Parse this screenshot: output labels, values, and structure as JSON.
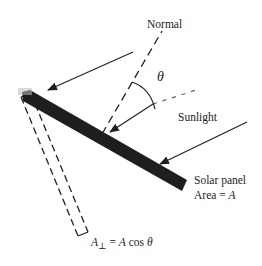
{
  "diagram": {
    "labels": {
      "normal": "Normal",
      "theta": "θ",
      "sunlight": "Sunlight",
      "panel_name": "Solar panel",
      "panel_area_prefix": "Area = ",
      "panel_area_var": "A",
      "projected_lhs_var": "A",
      "projected_lhs_sub": "⊥",
      "projected_eq": " = ",
      "projected_rhs_var": "A",
      "projected_rhs_cos": " cos ",
      "projected_rhs_theta": "θ"
    },
    "colors": {
      "panel": "#1e1e1e",
      "lines": "#222222",
      "background": "#ffffff"
    }
  }
}
